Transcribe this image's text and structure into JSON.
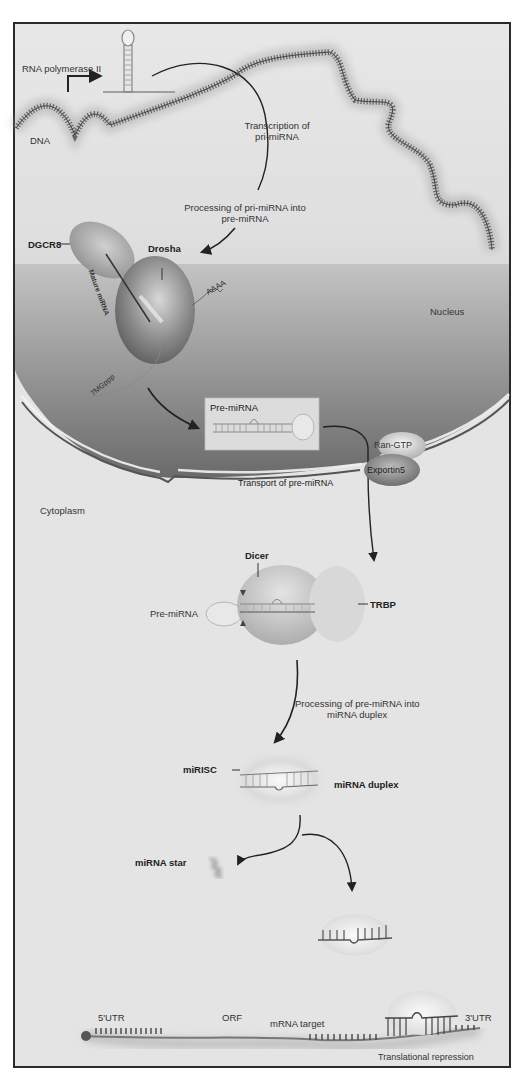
{
  "compartments": {
    "nucleus": "Nucleus",
    "cytoplasm": "Cytoplasm"
  },
  "labels": {
    "rna_polymerase": "RNA polymerase II",
    "dna": "DNA",
    "transcription_line1": "Transcription of",
    "transcription_line2": "pri-miRNA",
    "processing_pri_line1": "Processing of pri-miRNA into",
    "processing_pri_line2": "pre-miRNA",
    "dgcr8": "DGCR8",
    "drosha": "Drosha",
    "mature_mirna": "Mature miRNA",
    "polya": "AAAA",
    "cap": "7MGppp",
    "pre_mirna_box": "Pre-miRNA",
    "ran_gtp": "Ran-GTP",
    "exportin5": "Exportin5",
    "transport": "Transport of pre-miRNA",
    "dicer": "Dicer",
    "pre_mirna_dicer": "Pre-miRNA",
    "trbp": "TRBP",
    "processing_pre_line1": "Processing of pre-miRNA into",
    "processing_pre_line2": "miRNA duplex",
    "mirisc": "miRISC",
    "mirna_duplex": "miRNA duplex",
    "mirna_star": "miRNA star",
    "utr5": "5'UTR",
    "orf": "ORF",
    "mrna_target": "mRNA target",
    "utr3": "3'UTR",
    "translational_repression": "Translational repression"
  },
  "colors": {
    "frame": "#2a2a2a",
    "background": "#e6e6e6",
    "nucleus_top": "#e8e8e8",
    "nucleus_bottom": "#6e6e6e",
    "membrane": "#555555",
    "protein_light": "#d4d4d4",
    "protein_dark": "#7a7a7a",
    "arrow": "#222222",
    "text": "#333333"
  }
}
